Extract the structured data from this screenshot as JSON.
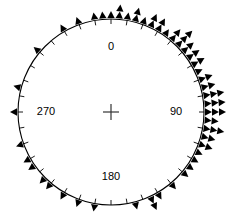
{
  "chart_data": {
    "type": "bar",
    "title": "",
    "subtitle": "",
    "xlabel": "",
    "ylabel": "",
    "plot_kind": "circular-histogram-stacked-triangles",
    "grid": false,
    "legend": false,
    "angular_axis": {
      "units": "degrees",
      "range": [
        0,
        360
      ],
      "zero_at": "top",
      "direction": "clockwise",
      "tick_interval": 10,
      "labeled_ticks": [
        "0",
        "90",
        "180",
        "270"
      ],
      "tick_labels": [
        {
          "angle": 0,
          "text": "0"
        },
        {
          "angle": 90,
          "text": "90"
        },
        {
          "angle": 180,
          "text": "180"
        },
        {
          "angle": 270,
          "text": "270"
        }
      ]
    },
    "center_marker": "plus-cross",
    "marker_shape": "filled-triangle",
    "marker_color": "#000000",
    "circle_color": "#000000",
    "bin_width": 5,
    "categories": [
      0,
      5,
      10,
      15,
      20,
      25,
      30,
      35,
      40,
      45,
      50,
      55,
      60,
      65,
      70,
      75,
      80,
      85,
      90,
      95,
      100,
      105,
      110,
      115,
      120,
      125,
      130,
      135,
      140,
      145,
      150,
      155,
      160,
      165,
      170,
      175,
      180,
      185,
      190,
      195,
      200,
      205,
      210,
      215,
      220,
      225,
      230,
      235,
      240,
      245,
      250,
      255,
      260,
      265,
      270,
      275,
      280,
      285,
      290,
      295,
      300,
      305,
      310,
      315,
      320,
      325,
      330,
      335,
      340,
      345,
      350,
      355
    ],
    "values": [
      1,
      2,
      1,
      2,
      1,
      2,
      2,
      1,
      2,
      3,
      2,
      2,
      2,
      1,
      2,
      2,
      3,
      3,
      3,
      2,
      3,
      2,
      2,
      1,
      1,
      1,
      1,
      0,
      1,
      0,
      1,
      2,
      0,
      1,
      0,
      0,
      0,
      0,
      1,
      0,
      1,
      0,
      1,
      0,
      1,
      1,
      0,
      1,
      1,
      0,
      1,
      0,
      0,
      0,
      1,
      0,
      0,
      1,
      0,
      0,
      0,
      0,
      1,
      0,
      0,
      0,
      1,
      0,
      1,
      0,
      1,
      1
    ],
    "ylim": [
      0,
      3
    ]
  },
  "figure": {
    "geometry": {
      "center_x": 111,
      "center_y": 112,
      "radius": 93,
      "tick_length": 5,
      "marker_size": 7,
      "marker_gap": 7
    }
  }
}
